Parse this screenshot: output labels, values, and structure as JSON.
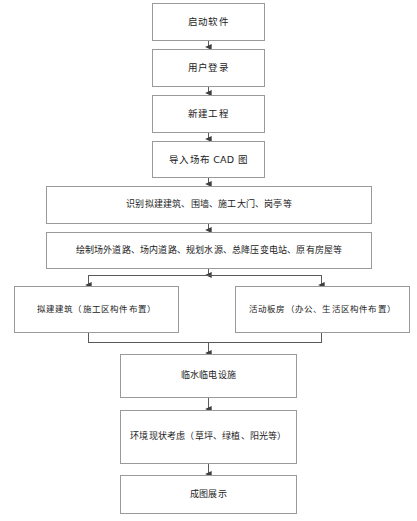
{
  "diagram": {
    "type": "flowchart",
    "orientation": "vertical",
    "background_color": "#ffffff",
    "box_border_color": "#9a9a9a",
    "connector_color": "#4a4a4a",
    "text_color": "#222222",
    "nodes": [
      {
        "id": "n1",
        "label": "启动软件",
        "shape": "rectangle"
      },
      {
        "id": "n2",
        "label": "用户登录",
        "shape": "rectangle"
      },
      {
        "id": "n3",
        "label": "新建工程",
        "shape": "rectangle"
      },
      {
        "id": "n4",
        "label": "导入场布 CAD 图",
        "shape": "rectangle"
      },
      {
        "id": "n5",
        "label": "识别拟建建筑、围墙、施工大门、岗亭等",
        "shape": "rectangle"
      },
      {
        "id": "n6",
        "label": "绘制场外道路、场内道路、规划水源、总降压变电站、原有房屋等",
        "shape": "rectangle"
      },
      {
        "id": "n7",
        "label": "拟建建筑（施工区构件布置）",
        "shape": "rectangle"
      },
      {
        "id": "n8",
        "label": "活动板房（办公、生活区构件布置）",
        "shape": "rectangle"
      },
      {
        "id": "n9",
        "label": "临水临电设施",
        "shape": "rectangle"
      },
      {
        "id": "n10",
        "label": "环境现状考虑（草坪、绿植、阳光等）",
        "shape": "rectangle"
      },
      {
        "id": "n11",
        "label": "成图展示",
        "shape": "rectangle"
      }
    ],
    "edges": [
      {
        "from": "n1",
        "to": "n2",
        "arrow": "down"
      },
      {
        "from": "n2",
        "to": "n3",
        "arrow": "down"
      },
      {
        "from": "n3",
        "to": "n4",
        "arrow": "down"
      },
      {
        "from": "n4",
        "to": "n5",
        "arrow": "down"
      },
      {
        "from": "n5",
        "to": "n6",
        "arrow": "down"
      },
      {
        "from": "n6",
        "to": "n7",
        "arrow": "down-split-left"
      },
      {
        "from": "n6",
        "to": "n8",
        "arrow": "down-split-right"
      },
      {
        "from": "n7",
        "to": "n9",
        "arrow": "merge-down"
      },
      {
        "from": "n8",
        "to": "n9",
        "arrow": "merge-down"
      },
      {
        "from": "n9",
        "to": "n10",
        "arrow": "down"
      },
      {
        "from": "n10",
        "to": "n11",
        "arrow": "down"
      }
    ]
  }
}
